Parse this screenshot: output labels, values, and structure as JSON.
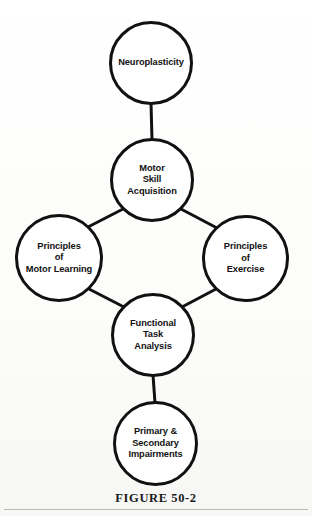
{
  "figure": {
    "caption": "FIGURE 50-2",
    "title": "FIGURE 50-2",
    "stroke_color": "#111111",
    "node_fill_color": "#ffffff",
    "background_color": "#fdfdfb",
    "rule_color": "#b9b9b9"
  },
  "diagram": {
    "type": "node-link-flow",
    "nodes": [
      {
        "id": "neuroplasticity",
        "label": "Neuroplasticity",
        "lines": [
          "Neuroplasticity"
        ],
        "cx": 151,
        "cy": 63,
        "r": 42
      },
      {
        "id": "motor-skill-acquisition",
        "label": "Motor Skill Acquisition",
        "lines": [
          "Motor",
          "Skill",
          "Acquisition"
        ],
        "cx": 152,
        "cy": 180,
        "r": 42
      },
      {
        "id": "principles-motor-learning",
        "label": "Principles of Motor Learning",
        "lines": [
          "Principles",
          "of",
          "Motor Learning"
        ],
        "cx": 59,
        "cy": 258,
        "r": 44
      },
      {
        "id": "principles-exercise",
        "label": "Principles of Exercise",
        "lines": [
          "Principles",
          "of",
          "Exercise"
        ],
        "cx": 245,
        "cy": 258,
        "r": 43
      },
      {
        "id": "functional-task-analysis",
        "label": "Functional Task Analysis",
        "lines": [
          "Functional",
          "Task",
          "Analysis"
        ],
        "cx": 153,
        "cy": 335,
        "r": 42
      },
      {
        "id": "primary-secondary-impairments",
        "label": "Primary & Secondary Impairments",
        "lines": [
          "Primary &",
          "Secondary",
          "Impairments"
        ],
        "cx": 155,
        "cy": 443,
        "r": 42
      }
    ],
    "edges": [
      {
        "id": "edge-neuro-motor",
        "from": "neuroplasticity",
        "to": "motor-skill-acquisition",
        "x1": 151,
        "y1": 105,
        "x2": 152,
        "y2": 138
      },
      {
        "id": "edge-motor-pml",
        "from": "motor-skill-acquisition",
        "to": "principles-motor-learning",
        "x1": 122,
        "y1": 210,
        "x2": 89,
        "y2": 227
      },
      {
        "id": "edge-motor-pex",
        "from": "motor-skill-acquisition",
        "to": "principles-exercise",
        "x1": 182,
        "y1": 210,
        "x2": 216,
        "y2": 228
      },
      {
        "id": "edge-pml-fta",
        "from": "principles-motor-learning",
        "to": "functional-task-analysis",
        "x1": 90,
        "y1": 290,
        "x2": 123,
        "y2": 306
      },
      {
        "id": "edge-pex-fta",
        "from": "principles-exercise",
        "to": "functional-task-analysis",
        "x1": 215,
        "y1": 290,
        "x2": 183,
        "y2": 306
      },
      {
        "id": "edge-fta-impairments",
        "from": "functional-task-analysis",
        "to": "primary-secondary-impairments",
        "x1": 153,
        "y1": 377,
        "x2": 155,
        "y2": 401
      }
    ]
  }
}
